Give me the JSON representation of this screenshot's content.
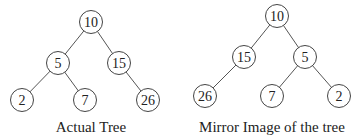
{
  "trees": [
    {
      "id": "actual",
      "caption": "Actual Tree",
      "nodes": [
        {
          "id": "a10",
          "label": "10"
        },
        {
          "id": "a5",
          "label": "5"
        },
        {
          "id": "a15",
          "label": "15"
        },
        {
          "id": "a2",
          "label": "2"
        },
        {
          "id": "a7",
          "label": "7"
        },
        {
          "id": "a26",
          "label": "26"
        }
      ],
      "edges": [
        [
          "a10",
          "a5"
        ],
        [
          "a10",
          "a15"
        ],
        [
          "a5",
          "a2"
        ],
        [
          "a5",
          "a7"
        ],
        [
          "a15",
          "a26"
        ]
      ]
    },
    {
      "id": "mirror",
      "caption": "Mirror Image of the tree",
      "nodes": [
        {
          "id": "m10",
          "label": "10"
        },
        {
          "id": "m15",
          "label": "15"
        },
        {
          "id": "m5",
          "label": "5"
        },
        {
          "id": "m26",
          "label": "26"
        },
        {
          "id": "m7",
          "label": "7"
        },
        {
          "id": "m2",
          "label": "2"
        }
      ],
      "edges": [
        [
          "m10",
          "m15"
        ],
        [
          "m10",
          "m5"
        ],
        [
          "m15",
          "m26"
        ],
        [
          "m5",
          "m7"
        ],
        [
          "m5",
          "m2"
        ]
      ]
    }
  ]
}
